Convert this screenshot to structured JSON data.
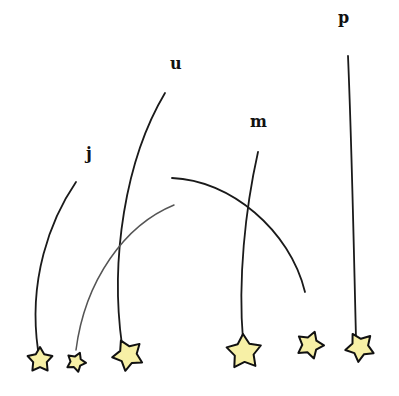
{
  "illustration": {
    "background": "#ffffff",
    "star_fill": "#f7f0a6",
    "stroke_color": "#111111",
    "labels": [
      {
        "id": "j",
        "text": "j",
        "x": 86,
        "y": 146
      },
      {
        "id": "u",
        "text": "u",
        "x": 170,
        "y": 56
      },
      {
        "id": "m",
        "text": "m",
        "x": 250,
        "y": 114
      },
      {
        "id": "p",
        "text": "p",
        "x": 338,
        "y": 10
      }
    ],
    "strings": [
      {
        "id": "j",
        "path": "M76,182 C50,220 28,280 38,350"
      },
      {
        "id": "u",
        "path": "M165,93 C125,160 110,260 122,345"
      },
      {
        "id": "m",
        "path": "M258,152 C245,210 238,280 243,340"
      },
      {
        "id": "p",
        "path": "M348,56 C352,150 354,260 356,338"
      },
      {
        "id": "arc-to-right",
        "path": "M172,178 C230,180 290,230 305,292"
      },
      {
        "id": "arc-to-left",
        "path": "M174,205 C125,225 85,280 76,350",
        "faint": true
      }
    ],
    "stars": [
      {
        "id": "star-j",
        "cx": 40,
        "cy": 360,
        "r": 13
      },
      {
        "id": "star-small",
        "cx": 76,
        "cy": 362,
        "r": 10
      },
      {
        "id": "star-u",
        "cx": 128,
        "cy": 355,
        "r": 16
      },
      {
        "id": "star-m",
        "cx": 244,
        "cy": 352,
        "r": 18
      },
      {
        "id": "star-free",
        "cx": 310,
        "cy": 345,
        "r": 14
      },
      {
        "id": "star-p",
        "cx": 360,
        "cy": 347,
        "r": 15
      }
    ]
  }
}
